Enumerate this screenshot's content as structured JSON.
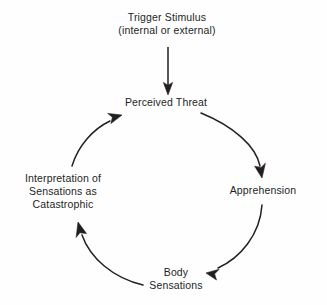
{
  "diagram": {
    "ink_color": "#231f1f",
    "background_color": "#fefefe",
    "nodes": [
      {
        "id": "trigger_stimulus",
        "lines": [
          "Trigger Stimulus",
          "(internal or external)"
        ]
      },
      {
        "id": "perceived_threat",
        "lines": [
          "Perceived Threat"
        ]
      },
      {
        "id": "apprehension",
        "lines": [
          "Apprehension"
        ]
      },
      {
        "id": "body_sensations",
        "lines": [
          "Body",
          "Sensations"
        ]
      },
      {
        "id": "interpretation",
        "lines": [
          "Interpretation of",
          "Sensations as",
          "Catastrophic"
        ]
      }
    ],
    "trigger": {
      "line1": "Trigger Stimulus",
      "line2": "(internal or external)"
    },
    "perceived_threat": {
      "line1": "Perceived Threat"
    },
    "apprehension": {
      "line1": "Apprehension"
    },
    "body_sensations": {
      "line1": "Body",
      "line2": "Sensations"
    },
    "interpretation": {
      "line1": "Interpretation of",
      "line2": "Sensations as",
      "line3": "Catastrophic"
    },
    "arrows": [
      {
        "id": "trigger-to-perceived-threat",
        "from": "trigger_stimulus",
        "to": "perceived_threat",
        "style": "straight-down"
      },
      {
        "id": "perceived-threat-to-apprehension",
        "from": "perceived_threat",
        "to": "apprehension",
        "style": "curve-clockwise"
      },
      {
        "id": "apprehension-to-body-sensations",
        "from": "apprehension",
        "to": "body_sensations",
        "style": "curve-clockwise"
      },
      {
        "id": "body-sensations-to-interpretation",
        "from": "body_sensations",
        "to": "interpretation",
        "style": "curve-clockwise"
      },
      {
        "id": "interpretation-to-perceived-threat",
        "from": "interpretation",
        "to": "perceived_threat",
        "style": "curve-clockwise"
      }
    ]
  }
}
